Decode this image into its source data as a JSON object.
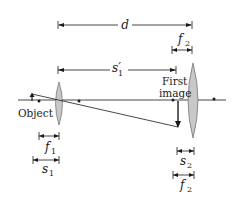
{
  "diagram": {
    "type": "two-lens optical system",
    "labels": {
      "d": "d",
      "f2_top": "f",
      "f2_top_sub": "2",
      "s1_prime": "s′",
      "s1_prime_sub": "1",
      "first_image_line1": "First",
      "first_image_line2": "image",
      "object": "Object",
      "f1": "f",
      "f1_sub": "1",
      "s1": "s",
      "s1_sub": "1",
      "s2": "s",
      "s2_sub": "2",
      "f2_bottom": "f",
      "f2_bottom_sub": "2"
    },
    "colors": {
      "line": "#1a1a1a",
      "lens_fill": "#c8c8c8",
      "lens_stroke": "#555555",
      "background": "#ffffff"
    },
    "elements": {
      "lens1": "converging lens 1",
      "lens2": "converging lens 2",
      "object_arrow": "upright object",
      "image_arrow": "inverted first image",
      "focal_points": 4
    }
  }
}
